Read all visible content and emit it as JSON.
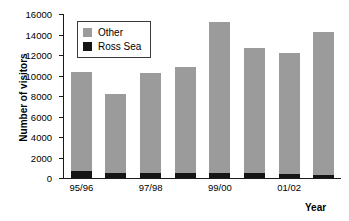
{
  "chart_data": {
    "type": "bar",
    "title": "",
    "subtitle": "",
    "xlabel": "Year",
    "ylabel": "Number of visitors",
    "stacked": true,
    "grid": false,
    "legend_position": "top-left",
    "ylim": [
      0,
      16000
    ],
    "ytick_step": 2000,
    "yticks": [
      "16000",
      "14000",
      "12000",
      "10000",
      "8000",
      "6000",
      "4000",
      "2000",
      "0"
    ],
    "ytick_values": [
      16000,
      14000,
      12000,
      10000,
      8000,
      6000,
      4000,
      2000,
      0
    ],
    "categories": [
      "95/96",
      "96/97",
      "97/98",
      "98/99",
      "99/00",
      "00/01",
      "01/02",
      "02/03"
    ],
    "xtick_labels_shown": [
      "95/96",
      "97/98",
      "99/00",
      "01/02"
    ],
    "series": [
      {
        "name": "Ross Sea",
        "color": "#151515",
        "values": [
          700,
          450,
          450,
          450,
          450,
          450,
          350,
          300
        ]
      },
      {
        "name": "Other",
        "color": "#9b9b9b",
        "values": [
          9600,
          7750,
          9750,
          10350,
          14750,
          12250,
          11850,
          13900
        ]
      }
    ],
    "totals": [
      10300,
      8200,
      10200,
      10800,
      15200,
      12700,
      12200,
      14200
    ],
    "legend": [
      {
        "label": "Other",
        "color": "#9b9b9b",
        "swatch": "square-gray"
      },
      {
        "label": "Ross Sea",
        "color": "#151515",
        "swatch": "square-black"
      }
    ]
  }
}
